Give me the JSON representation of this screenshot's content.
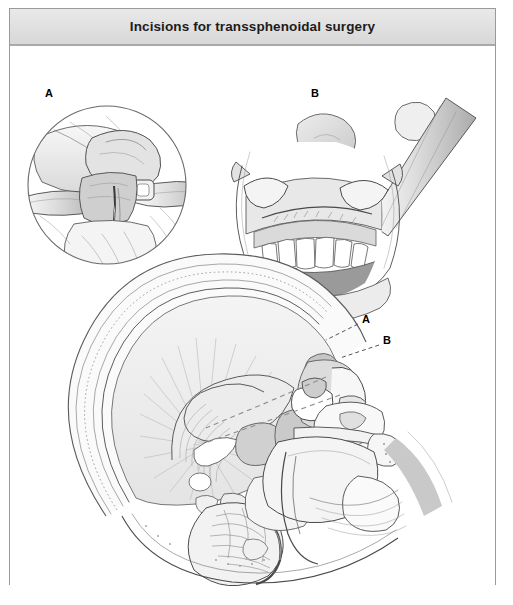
{
  "figure": {
    "title": "Incisions for transsphenoidal surgery",
    "width": 513,
    "height": 605,
    "style": "grayscale medical line illustration"
  },
  "panels": [
    {
      "id": "A",
      "label": "A",
      "label_x": 44,
      "label_y": 84,
      "view": "circular close-up, endonasal transseptal incision",
      "description": "Circular inset view of the nasal vestibule with a retractor elevating the nasal ala and a scalpel making a hemitransfixion incision along the nasal septum",
      "elements": [
        "nasal ala",
        "nasal septum",
        "retractor",
        "scalpel blade",
        "columella"
      ]
    },
    {
      "id": "B",
      "label": "B",
      "label_x": 310,
      "label_y": 84,
      "view": "open mouth, sublabial incision",
      "description": "Anterior view of the open mouth with cheek retractors exposing the upper gingiva and maxillary teeth while a scalpel makes a sublabial incision above the upper incisors",
      "elements": [
        "upper lip",
        "retractors",
        "gingiva",
        "maxillary teeth",
        "scalpel",
        "tongue depressor",
        "oral cavity"
      ]
    },
    {
      "id": "sagittal",
      "label": "",
      "view": "midsagittal section of head",
      "description": "Midsagittal anatomic section of the head showing brain, skull, nasal cavity, sphenoid sinus and sella turcica, with dashed lines marking the two surgical approach trajectories",
      "elements": [
        "scalp",
        "calvaria",
        "cerebral hemisphere",
        "corpus callosum",
        "thalamus",
        "cerebellum",
        "brainstem",
        "sphenoid sinus",
        "sella turcica",
        "pituitary",
        "nasal cavity",
        "turbinates",
        "hard palate",
        "tongue",
        "mandible",
        "upper lip"
      ]
    }
  ],
  "callouts": [
    {
      "label": "A",
      "label_x": 356,
      "label_y": 311,
      "leader_from_x": 348,
      "leader_from_y": 315,
      "leader_to_x": 316,
      "leader_to_y": 331,
      "meaning": "endonasal transseptal approach trajectory"
    },
    {
      "label": "B",
      "label_x": 377,
      "label_y": 332,
      "leader_from_x": 369,
      "leader_from_y": 336,
      "leader_to_x": 330,
      "leader_to_y": 349,
      "meaning": "sublabial transseptal approach trajectory"
    }
  ],
  "colors": {
    "frame_border": "#9a9a9a",
    "title_bar_top": "#e9e9e9",
    "title_bar_bottom": "#d8d8d8",
    "title_rule": "#a8a8a8",
    "title_text": "#1c1c1c",
    "canvas": "#ffffff",
    "ink": "#4a4a4a",
    "fill_light": "#f0f0f0",
    "fill_mid": "#d2d2d2",
    "fill_dark": "#9a9a9a",
    "leader_line": "#555555"
  }
}
